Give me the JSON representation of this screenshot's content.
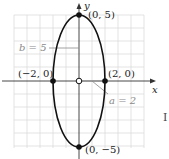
{
  "diagram": {
    "type": "ellipse-graph",
    "equation_params": {
      "a": 2,
      "b": 5,
      "center": [
        0,
        0
      ],
      "major_axis": "vertical"
    },
    "axes": {
      "x_label": "x",
      "y_label": "y"
    },
    "vertices": [
      {
        "label": "(0, 5)",
        "x": 0,
        "y": 5
      },
      {
        "label": "(0, −5)",
        "x": 0,
        "y": -5
      }
    ],
    "co_vertices": [
      {
        "label": "(−2, 0)",
        "x": -2,
        "y": 0
      },
      {
        "label": "(2, 0)",
        "x": 2,
        "y": 0
      }
    ],
    "annotations": {
      "b_label": "b = 5",
      "a_label": "a = 2"
    },
    "edge_text": "I",
    "colors": {
      "curve": "#111111",
      "grid": "#dcdcdc",
      "axis": "#333333",
      "annotation": "#8a8a8a",
      "a_segment": "#9a9a9a"
    }
  }
}
